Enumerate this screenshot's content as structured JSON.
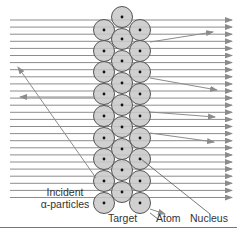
{
  "figure": {
    "colors": {
      "beam": "#8c8c8c",
      "atom_fill": "#c8c8c8",
      "atom_stroke": "#555555",
      "nucleus": "#111111",
      "text": "#333333",
      "rule": "#777777"
    },
    "labels": {
      "incident_line1": "Incident",
      "incident_line2": "α-particles",
      "target": "Target",
      "atom": "Atom",
      "nucleus": "Nucleus"
    },
    "beam": {
      "x_start": 10,
      "x_end": 232,
      "y_first": 20,
      "spacing": 7.1,
      "count": 26
    },
    "atoms": {
      "radius": 10.5,
      "columns": [
        {
          "x": 104,
          "ys": [
            30,
            51,
            72,
            94,
            116,
            138,
            159,
            181,
            203
          ]
        },
        {
          "x": 122,
          "ys": [
            17,
            39,
            61,
            83,
            105,
            127,
            149,
            170,
            192
          ]
        },
        {
          "x": 140,
          "ys": [
            30,
            51,
            72,
            94,
            116,
            138,
            159,
            181,
            203
          ]
        }
      ]
    },
    "deflected_paths": [
      {
        "from": [
          150,
          42
        ],
        "to": [
          213,
          32
        ]
      },
      {
        "from": [
          150,
          78
        ],
        "to": [
          217,
          90
        ]
      },
      {
        "from": [
          150,
          112
        ],
        "to": [
          215,
          117
        ]
      },
      {
        "from": [
          150,
          133
        ],
        "to": [
          214,
          142
        ]
      },
      {
        "from": [
          150,
          209
        ],
        "to": [
          165,
          214
        ]
      }
    ],
    "backscattered_paths": [
      {
        "from": [
          95,
          97
        ],
        "to": [
          20,
          97
        ]
      },
      {
        "from": [
          96,
          178
        ],
        "to": [
          18,
          67
        ]
      }
    ],
    "leader_lines": {
      "atom": {
        "from": [
          150,
          213
        ],
        "to": [
          158,
          219
        ]
      },
      "nucleus": {
        "from": [
          141,
          159
        ],
        "to": [
          210,
          214
        ]
      }
    }
  }
}
